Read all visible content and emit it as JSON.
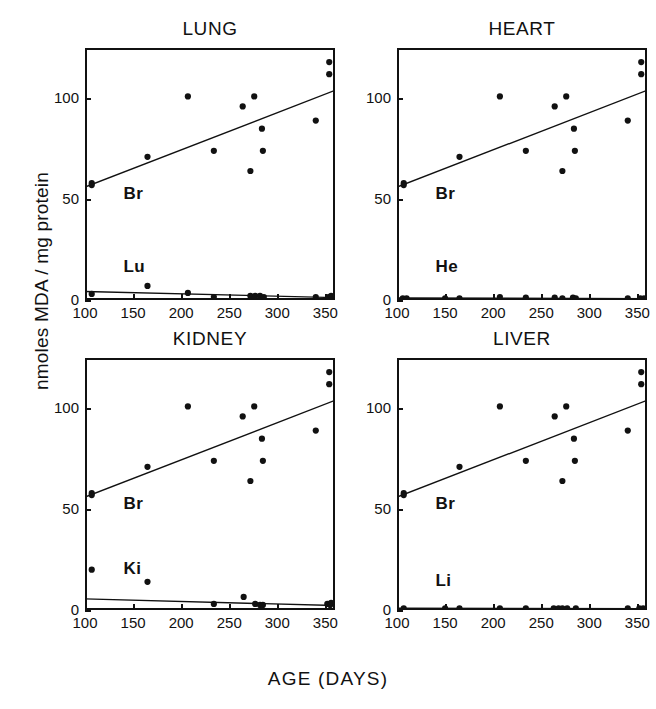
{
  "figure": {
    "xlabel": "AGE   (DAYS)",
    "ylabel": "nmoles MDA / mg protein"
  },
  "axes": {
    "xlim": [
      100,
      360
    ],
    "ylim": [
      0,
      125
    ],
    "xticks": [
      100,
      150,
      200,
      250,
      300,
      350
    ],
    "xticklabels": [
      "100",
      "150",
      "200",
      "250",
      "300",
      "350"
    ],
    "yticks": [
      0,
      50,
      100
    ],
    "yticklabels": [
      "0",
      "50",
      "100"
    ]
  },
  "chart_data": {
    "type": "scatter",
    "xlabel": "AGE   (DAYS)",
    "ylabel": "nmoles MDA / mg protein",
    "xlim": [
      100,
      360
    ],
    "ylim": [
      0,
      125
    ],
    "grid": false,
    "legend": "inline-series-labels",
    "panels": [
      {
        "title": "LUNG",
        "series": [
          {
            "name": "Br",
            "label": "Br",
            "label_x": 140,
            "label_y": 52,
            "marker": "filled-circle",
            "points": [
              [
                107,
                58
              ],
              [
                107,
                57
              ],
              [
                165,
                71
              ],
              [
                207,
                101
              ],
              [
                234,
                74
              ],
              [
                264,
                96
              ],
              [
                272,
                64
              ],
              [
                276,
                101
              ],
              [
                284,
                85
              ],
              [
                285,
                74
              ],
              [
                340,
                89
              ],
              [
                354,
                118
              ],
              [
                354,
                112
              ]
            ],
            "fit_line": {
              "x": [
                100,
                360
              ],
              "y": [
                56,
                104
              ]
            }
          },
          {
            "name": "Lu",
            "label": "Lu",
            "label_x": 140,
            "label_y": 16,
            "marker": "filled-circle",
            "points": [
              [
                107,
                3
              ],
              [
                165,
                7
              ],
              [
                207,
                3.5
              ],
              [
                234,
                1.5
              ],
              [
                272,
                2
              ],
              [
                277,
                2
              ],
              [
                282,
                2
              ],
              [
                286,
                1.5
              ],
              [
                340,
                1.5
              ],
              [
                353,
                1.5
              ],
              [
                356,
                2
              ]
            ],
            "fit_line": {
              "x": [
                100,
                360
              ],
              "y": [
                4.2,
                1.2
              ]
            }
          }
        ]
      },
      {
        "title": "HEART",
        "series": [
          {
            "name": "Br",
            "label": "Br",
            "label_x": 140,
            "label_y": 52,
            "marker": "filled-circle",
            "points": [
              [
                107,
                58
              ],
              [
                107,
                57
              ],
              [
                165,
                71
              ],
              [
                207,
                101
              ],
              [
                234,
                74
              ],
              [
                264,
                96
              ],
              [
                272,
                64
              ],
              [
                276,
                101
              ],
              [
                284,
                85
              ],
              [
                285,
                74
              ],
              [
                340,
                89
              ],
              [
                354,
                118
              ],
              [
                354,
                112
              ]
            ],
            "fit_line": {
              "x": [
                100,
                360
              ],
              "y": [
                56,
                104
              ]
            }
          },
          {
            "name": "He",
            "label": "He",
            "label_x": 140,
            "label_y": 16,
            "marker": "filled-circle",
            "points": [
              [
                106,
                0.8
              ],
              [
                110,
                0.8
              ],
              [
                150,
                0.8
              ],
              [
                165,
                0.8
              ],
              [
                207,
                1.5
              ],
              [
                234,
                1.2
              ],
              [
                264,
                1.2
              ],
              [
                272,
                0.8
              ],
              [
                283,
                1.2
              ],
              [
                286,
                0.8
              ],
              [
                340,
                0.8
              ],
              [
                353,
                0.8
              ],
              [
                357,
                0.8
              ]
            ],
            "fit_line": {
              "x": [
                100,
                360
              ],
              "y": [
                1.0,
                0.7
              ]
            }
          }
        ]
      },
      {
        "title": "KIDNEY",
        "series": [
          {
            "name": "Br",
            "label": "Br",
            "label_x": 140,
            "label_y": 52,
            "marker": "filled-circle",
            "points": [
              [
                107,
                58
              ],
              [
                107,
                57
              ],
              [
                165,
                71
              ],
              [
                207,
                101
              ],
              [
                234,
                74
              ],
              [
                264,
                96
              ],
              [
                272,
                64
              ],
              [
                276,
                101
              ],
              [
                284,
                85
              ],
              [
                285,
                74
              ],
              [
                340,
                89
              ],
              [
                354,
                118
              ],
              [
                354,
                112
              ]
            ],
            "fit_line": {
              "x": [
                100,
                360
              ],
              "y": [
                56,
                104
              ]
            }
          },
          {
            "name": "Ki",
            "label": "Ki",
            "label_x": 140,
            "label_y": 20,
            "marker": "filled-circle",
            "points": [
              [
                107,
                20
              ],
              [
                165,
                14
              ],
              [
                234,
                3
              ],
              [
                265,
                6.5
              ],
              [
                277,
                3
              ],
              [
                282,
                2.5
              ],
              [
                285,
                2.5
              ],
              [
                352,
                3
              ],
              [
                355,
                2.5
              ],
              [
                356,
                3.5
              ]
            ],
            "fit_line": {
              "x": [
                100,
                360
              ],
              "y": [
                5.5,
                2.2
              ]
            }
          }
        ]
      },
      {
        "title": "LIVER",
        "series": [
          {
            "name": "Br",
            "label": "Br",
            "label_x": 140,
            "label_y": 52,
            "marker": "filled-circle",
            "points": [
              [
                107,
                58
              ],
              [
                107,
                57
              ],
              [
                165,
                71
              ],
              [
                207,
                101
              ],
              [
                234,
                74
              ],
              [
                264,
                96
              ],
              [
                272,
                64
              ],
              [
                276,
                101
              ],
              [
                284,
                85
              ],
              [
                285,
                74
              ],
              [
                340,
                89
              ],
              [
                354,
                118
              ],
              [
                354,
                112
              ]
            ],
            "fit_line": {
              "x": [
                100,
                360
              ],
              "y": [
                56,
                104
              ]
            }
          },
          {
            "name": "Li",
            "label": "Li",
            "label_x": 140,
            "label_y": 14,
            "marker": "filled-circle",
            "points": [
              [
                107,
                0.8
              ],
              [
                150,
                0.8
              ],
              [
                165,
                0.8
              ],
              [
                207,
                0.8
              ],
              [
                234,
                0.8
              ],
              [
                263,
                0.8
              ],
              [
                268,
                0.8
              ],
              [
                272,
                0.8
              ],
              [
                277,
                0.8
              ],
              [
                286,
                0.8
              ],
              [
                340,
                0.8
              ],
              [
                352,
                0.8
              ],
              [
                356,
                0.8
              ]
            ],
            "fit_line": {
              "x": [
                100,
                360
              ],
              "y": [
                0.9,
                0.7
              ]
            }
          }
        ]
      }
    ]
  },
  "colors": {
    "ink": "#111111",
    "background": "#ffffff"
  }
}
